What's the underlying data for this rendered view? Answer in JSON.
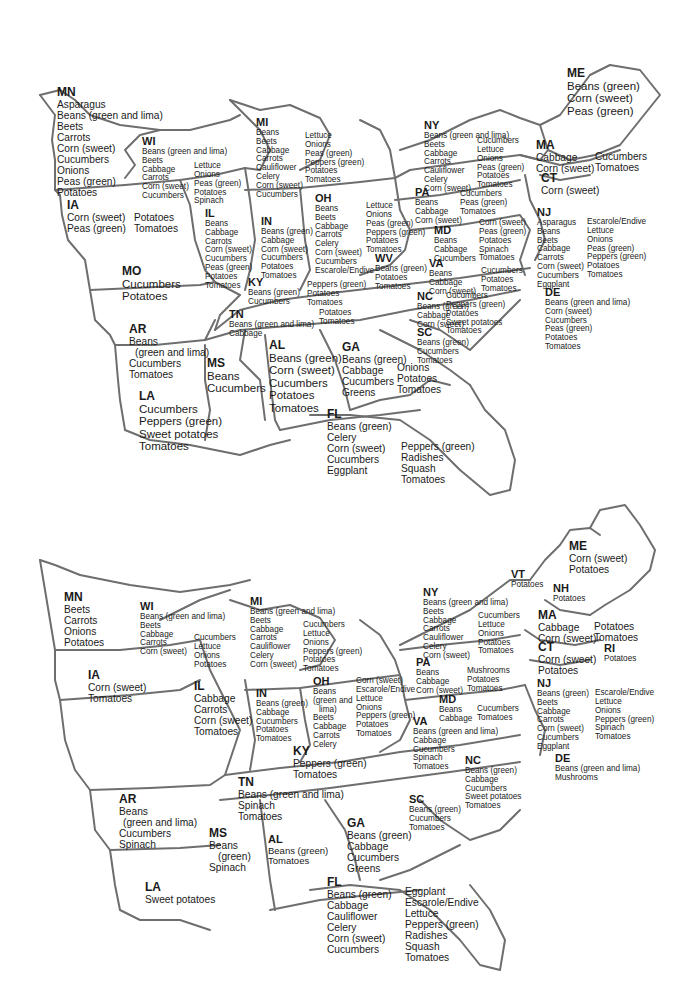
{
  "maps": [
    {
      "name": "top-map",
      "states": [
        {
          "abbr": "MN",
          "columns": [
            [
              "Asparagus",
              "Beans (green and lima)",
              "Beets",
              "Carrots",
              "Corn (sweet)",
              "Cucumbers",
              "Onions",
              "Peas (green)",
              "Potatoes"
            ]
          ]
        },
        {
          "abbr": "WI",
          "columns": [
            [
              "Beans (green and lima)",
              "Beets",
              "Cabbage",
              "Carrots",
              "Corn (sweet)",
              "Cucumbers"
            ],
            [
              "Lettuce",
              "Onions",
              "Peas (green)",
              "Potatoes",
              "Spinach"
            ]
          ]
        },
        {
          "abbr": "MI",
          "columns": [
            [
              "Beans",
              "Beets",
              "Cabbage",
              "Carrots",
              "Cauliflower",
              "Celery",
              "Corn (sweet)",
              "Cucumbers"
            ],
            [
              "Lettuce",
              "Onions",
              "Peas (green)",
              "Peppers (green)",
              "Potatoes",
              "Tomatoes"
            ]
          ]
        },
        {
          "abbr": "NY",
          "columns": [
            [
              "Beans (green and lima)",
              "Beets",
              "Cabbage",
              "Carrots",
              "Cauliflower",
              "Celery",
              "Corn (sweet)"
            ],
            [
              "Cucumbers",
              "Lettuce",
              "Onions",
              "Peas (green)",
              "Potatoes",
              "Tomatoes"
            ]
          ]
        },
        {
          "abbr": "ME",
          "columns": [
            [
              "Beans (green)",
              "Corn (sweet)",
              "Peas (green)"
            ]
          ]
        },
        {
          "abbr": "MA",
          "columns": [
            [
              "Cabbage",
              "Corn (sweet)"
            ],
            [
              "Cucumbers",
              "Tomatoes"
            ]
          ]
        },
        {
          "abbr": "CT",
          "columns": [
            [
              "Corn (sweet)"
            ]
          ]
        },
        {
          "abbr": "IA",
          "columns": [
            [
              "Corn (sweet)",
              "Peas (green)"
            ],
            [
              "Potatoes",
              "Tomatoes"
            ]
          ]
        },
        {
          "abbr": "IL",
          "columns": [
            [
              "Beans",
              "Cabbage",
              "Carrots",
              "Corn (sweet)",
              "Cucumbers",
              "Peas (green)",
              "Potatoes",
              "Tomatoes"
            ]
          ]
        },
        {
          "abbr": "IN",
          "columns": [
            [
              "Beans (green)",
              "Cabbage",
              "Corn (sweet)",
              "Cucumbers",
              "Potatoes",
              "Tomatoes"
            ]
          ]
        },
        {
          "abbr": "OH",
          "columns": [
            [
              "Beans",
              "Beets",
              "Cabbage",
              "Carrots",
              "Celery",
              "Corn (sweet)",
              "Cucumbers",
              "Escarole/Endive"
            ],
            [
              "Lettuce",
              "Onions",
              "Peas (green)",
              "Peppers (green)",
              "Potatoes",
              "Tomatoes"
            ]
          ]
        },
        {
          "abbr": "PA",
          "columns": [
            [
              "Beans",
              "Cabbage",
              "Corn (sweet)"
            ],
            [
              "Cucumbers",
              "Peas (green)",
              "Tomatoes"
            ]
          ]
        },
        {
          "abbr": "NJ",
          "columns": [
            [
              "Asparagus",
              "Beans",
              "Beets",
              "Cabbage",
              "Carrots",
              "Corn (sweet)",
              "Cucumbers",
              "Eggplant"
            ],
            [
              "Escarole/Endive",
              "Lettuce",
              "Onions",
              "Peas (green)",
              "Peppers (green)",
              "Potatoes",
              "Tomatoes"
            ]
          ]
        },
        {
          "abbr": "MD",
          "columns": [
            [
              "Beans",
              "Cabbage",
              "Cucumbers"
            ],
            [
              "Corn (sweet)",
              "Peas (green)",
              "Potatoes",
              "Spinach",
              "Tomatoes"
            ]
          ]
        },
        {
          "abbr": "WV",
          "columns": [
            [
              "Beans (green)",
              "Potatoes",
              "Tomatoes"
            ]
          ]
        },
        {
          "abbr": "VA",
          "columns": [
            [
              "Beans",
              "Cabbage",
              "Corn (sweet)"
            ],
            [
              "Cucumbers",
              "Potatoes",
              "Tomatoes"
            ]
          ]
        },
        {
          "abbr": "DE",
          "columns": [
            [
              "Beans (green and lima)",
              "Corn (sweet)",
              "Cucumbers",
              "Peas (green)",
              "Potatoes",
              "Tomatoes"
            ]
          ]
        },
        {
          "abbr": "MO",
          "columns": [
            [
              "Cucumbers",
              "Potatoes"
            ]
          ]
        },
        {
          "abbr": "KY",
          "columns": [
            [
              "Beans (green)",
              "Cucumbers"
            ],
            [
              "Peppers (green)",
              "Potatoes",
              "Tomatoes"
            ]
          ]
        },
        {
          "abbr": "NC",
          "columns": [
            [
              "Beans (green)",
              "Cabbage",
              "Corn (sweet)"
            ],
            [
              "Cucumbers",
              "Peppers (green)",
              "Potatoes",
              "Sweet potatoes",
              "Tomatoes"
            ]
          ]
        },
        {
          "abbr": "TN",
          "columns": [
            [
              "Beans (green and lima)",
              "Cabbage"
            ],
            [
              "Potatoes",
              "Tomatoes"
            ]
          ]
        },
        {
          "abbr": "AR",
          "columns": [
            [
              "Beans",
              "(green and lima)",
              "Cucumbers",
              "Tomatoes"
            ]
          ]
        },
        {
          "abbr": "SC",
          "columns": [
            [
              "Beans (green)",
              "Cucumbers",
              "Tomatoes"
            ]
          ]
        },
        {
          "abbr": "AL",
          "columns": [
            [
              "Beans (green)",
              "Corn (sweet)",
              "Cucumbers",
              "Potatoes",
              "Tomatoes"
            ]
          ]
        },
        {
          "abbr": "GA",
          "columns": [
            [
              "Beans (green)",
              "Cabbage",
              "Cucumbers",
              "Greens"
            ],
            [
              "Onions",
              "Potatoes",
              "Tomatoes"
            ]
          ]
        },
        {
          "abbr": "MS",
          "columns": [
            [
              "Beans",
              "Cucumbers"
            ]
          ]
        },
        {
          "abbr": "LA",
          "columns": [
            [
              "Cucumbers",
              "Peppers (green)",
              "Sweet potatoes",
              "Tomatoes"
            ]
          ]
        },
        {
          "abbr": "FL",
          "columns": [
            [
              "Beans (green)",
              "Celery",
              "Corn (sweet)",
              "Cucumbers",
              "Eggplant"
            ],
            [
              "Peppers (green)",
              "Radishes",
              "Squash",
              "Tomatoes"
            ]
          ]
        }
      ]
    },
    {
      "name": "bottom-map",
      "states": [
        {
          "abbr": "ME",
          "columns": [
            [
              "Corn (sweet)",
              "Potatoes"
            ]
          ]
        },
        {
          "abbr": "VT",
          "columns": [
            [
              "Potatoes"
            ]
          ]
        },
        {
          "abbr": "NH",
          "columns": [
            [
              "Potatoes"
            ]
          ]
        },
        {
          "abbr": "MN",
          "columns": [
            [
              "Beets",
              "Carrots",
              "Onions",
              "Potatoes"
            ]
          ]
        },
        {
          "abbr": "WI",
          "columns": [
            [
              "Beans (green and lima)",
              "Beets",
              "Cabbage",
              "Carrots",
              "Corn (sweet)"
            ],
            [
              "Cucumbers",
              "Lettuce",
              "Onions",
              "Potatoes"
            ]
          ]
        },
        {
          "abbr": "MI",
          "columns": [
            [
              "Beans (green and lima)",
              "Beets",
              "Cabbage",
              "Carrots",
              "Cauliflower",
              "Celery",
              "Corn (sweet)"
            ],
            [
              "Cucumbers",
              "Lettuce",
              "Onions",
              "Peppers (green)",
              "Potatoes",
              "Tomatoes"
            ]
          ]
        },
        {
          "abbr": "NY",
          "columns": [
            [
              "Beans (green and lima)",
              "Beets",
              "Cabbage",
              "Carrots",
              "Cauliflower",
              "Celery",
              "Corn (sweet)"
            ],
            [
              "Cucumbers",
              "Lettuce",
              "Onions",
              "Potatoes",
              "Tomatoes"
            ]
          ]
        },
        {
          "abbr": "MA",
          "columns": [
            [
              "Cabbage",
              "Corn (sweet)"
            ],
            [
              "Potatoes",
              "Tomatoes"
            ]
          ]
        },
        {
          "abbr": "CT",
          "columns": [
            [
              "Corn (sweet)",
              "Potatoes"
            ]
          ]
        },
        {
          "abbr": "RI",
          "columns": [
            [
              "Potatoes"
            ]
          ]
        },
        {
          "abbr": "IA",
          "columns": [
            [
              "Corn (sweet)",
              "Tomatoes"
            ]
          ]
        },
        {
          "abbr": "IL",
          "columns": [
            [
              "Cabbage",
              "Carrots",
              "Corn (sweet)",
              "Tomatoes"
            ]
          ]
        },
        {
          "abbr": "IN",
          "columns": [
            [
              "Beans (green)",
              "Cabbage",
              "Cucumbers",
              "Potatoes",
              "Tomatoes"
            ]
          ]
        },
        {
          "abbr": "OH",
          "columns": [
            [
              "Beans",
              "(green and",
              "lima)",
              "Beets",
              "Cabbage",
              "Carrots",
              "Celery"
            ],
            [
              "Corn (sweet)",
              "Escarole/Endive",
              "Lettuce",
              "Onions",
              "Peppers (green)",
              "Potatoes",
              "Tomatoes"
            ]
          ]
        },
        {
          "abbr": "PA",
          "columns": [
            [
              "Beans",
              "Cabbage",
              "Corn (sweet)"
            ],
            [
              "Mushrooms",
              "Potatoes",
              "Tomatoes"
            ]
          ]
        },
        {
          "abbr": "NJ",
          "columns": [
            [
              "Beans (green)",
              "Beets",
              "Cabbage",
              "Carrots",
              "Corn (sweet)",
              "Cucumbers",
              "Eggplant"
            ],
            [
              "Escarole/Endive",
              "Lettuce",
              "Onions",
              "Peppers (green)",
              "Spinach",
              "Tomatoes"
            ]
          ]
        },
        {
          "abbr": "MD",
          "columns": [
            [
              "Beans",
              "Cabbage"
            ],
            [
              "Cucumbers",
              "Tomatoes"
            ]
          ]
        },
        {
          "abbr": "VA",
          "columns": [
            [
              "Beans (green and lima)",
              "Cabbage",
              "Cucumbers",
              "Spinach",
              "Tomatoes"
            ]
          ]
        },
        {
          "abbr": "DE",
          "columns": [
            [
              "Beans (green and lima)",
              "Mushrooms"
            ]
          ]
        },
        {
          "abbr": "KY",
          "columns": [
            [
              "Peppers (green)",
              "Tomatoes"
            ]
          ]
        },
        {
          "abbr": "NC",
          "columns": [
            [
              "Beans (green)",
              "Cabbage",
              "Cucumbers",
              "Sweet potatoes",
              "Tomatoes"
            ]
          ]
        },
        {
          "abbr": "TN",
          "columns": [
            [
              "Beans (green and lima)",
              "Spinach",
              "Tomatoes"
            ]
          ]
        },
        {
          "abbr": "AR",
          "columns": [
            [
              "Beans",
              "(green and lima)",
              "Cucumbers",
              "Spinach"
            ]
          ]
        },
        {
          "abbr": "SC",
          "columns": [
            [
              "Beans (green)",
              "Cucumbers",
              "Tomatoes"
            ]
          ]
        },
        {
          "abbr": "MS",
          "columns": [
            [
              "Beans",
              "(green)",
              "Spinach"
            ]
          ]
        },
        {
          "abbr": "AL",
          "columns": [
            [
              "Beans (green)",
              "Tomatoes"
            ]
          ]
        },
        {
          "abbr": "GA",
          "columns": [
            [
              "Beans (green)",
              "Cabbage",
              "Cucumbers",
              "Greens"
            ]
          ]
        },
        {
          "abbr": "LA",
          "columns": [
            [
              "Sweet potatoes"
            ]
          ]
        },
        {
          "abbr": "FL",
          "columns": [
            [
              "Beans (green)",
              "Cabbage",
              "Cauliflower",
              "Celery",
              "Corn (sweet)",
              "Cucumbers"
            ],
            [
              "Eggplant",
              "Escarole/Endive",
              "Lettuce",
              "Peppers (green)",
              "Radishes",
              "Squash",
              "Tomatoes"
            ]
          ]
        }
      ]
    }
  ]
}
